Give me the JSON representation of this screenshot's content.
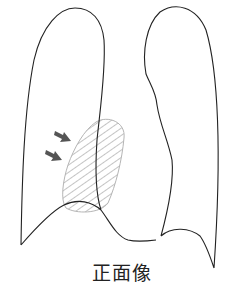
{
  "figure": {
    "caption": "正面像",
    "view": "frontal chest radiograph schematic",
    "colors": {
      "outline": "#222222",
      "hatch": "#8a8a8a",
      "lesion_border": "#b5b5b5",
      "arrow": "#555555",
      "background": "#ffffff"
    },
    "elements": {
      "right_lung": "right-lung-outline",
      "left_lung": "left-lung-outline",
      "lesion": "hatched-opacity-region",
      "arrows": 2
    }
  }
}
